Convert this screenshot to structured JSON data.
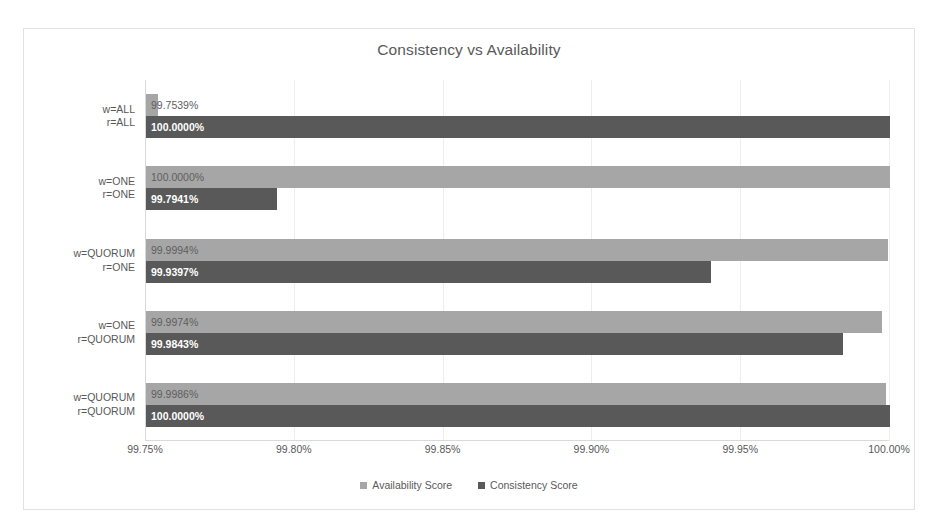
{
  "chart_data": {
    "type": "bar",
    "orientation": "horizontal",
    "title": "Consistency vs Availability",
    "xlabel": "",
    "ylabel": "",
    "xlim": [
      99.75,
      100.0
    ],
    "xticks": [
      "99.75%",
      "99.80%",
      "99.85%",
      "99.90%",
      "99.95%",
      "100.00%"
    ],
    "xtick_values": [
      99.75,
      99.8,
      99.85,
      99.9,
      99.95,
      100.0
    ],
    "grid": true,
    "legend_position": "bottom",
    "categories": [
      [
        "w=ALL",
        "r=ALL"
      ],
      [
        "w=ONE",
        "r=ONE"
      ],
      [
        "w=QUORUM",
        "r=ONE"
      ],
      [
        "w=ONE",
        "r=QUORUM"
      ],
      [
        "w=QUORUM",
        "r=QUORUM"
      ]
    ],
    "series": [
      {
        "name": "Availability Score",
        "color": "#a6a6a6",
        "values": [
          99.7539,
          100.0,
          99.9994,
          99.9974,
          99.9986
        ],
        "labels": [
          "99.7539%",
          "100.0000%",
          "99.9994%",
          "99.9974%",
          "99.9986%"
        ]
      },
      {
        "name": "Consistency Score",
        "color": "#595959",
        "values": [
          100.0,
          99.7941,
          99.9397,
          99.9843,
          100.0
        ],
        "labels": [
          "100.0000%",
          "99.7941%",
          "99.9397%",
          "99.9843%",
          "100.0000%"
        ]
      }
    ]
  },
  "legend": [
    {
      "label": "Availability Score",
      "color": "#a6a6a6"
    },
    {
      "label": "Consistency Score",
      "color": "#595959"
    }
  ]
}
